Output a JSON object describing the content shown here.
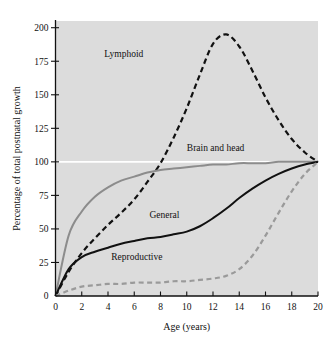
{
  "chart_data": {
    "type": "line",
    "title": "",
    "xlabel": "Age (years)",
    "ylabel": "Percentage of total postnatal growth",
    "xlim": [
      0,
      20
    ],
    "ylim": [
      0,
      205
    ],
    "xticks": [
      "0",
      "2",
      "4",
      "6",
      "8",
      "10",
      "12",
      "14",
      "16",
      "18",
      "20"
    ],
    "xtick_values": [
      0,
      2,
      4,
      6,
      8,
      10,
      12,
      14,
      16,
      18,
      20
    ],
    "yticks": [
      "25",
      "50",
      "75",
      "100",
      "125",
      "150",
      "175",
      "200"
    ],
    "ytick_values": [
      25,
      50,
      75,
      100,
      125,
      150,
      175,
      200
    ],
    "grid": false,
    "reference_line": {
      "value": 100,
      "color": "#ffffff",
      "label": "100 percent reference line"
    },
    "plot_background": "#dcdcdc",
    "legend_position": "inline-annotations",
    "x": [
      0,
      1,
      2,
      3,
      4,
      5,
      6,
      7,
      8,
      9,
      10,
      11,
      12,
      13,
      14,
      15,
      16,
      17,
      18,
      19,
      20
    ],
    "series": [
      {
        "name": "Lymphoid",
        "color": "#111111",
        "style": "dashed",
        "label_x": 5.2,
        "label_y": 178,
        "values": [
          0,
          18,
          32,
          43,
          53,
          62,
          72,
          85,
          99,
          118,
          140,
          165,
          188,
          195,
          186,
          168,
          148,
          131,
          117,
          107,
          100
        ]
      },
      {
        "name": "Brain and head",
        "color": "#8c8c8c",
        "style": "solid",
        "label_x": 12.2,
        "label_y": 108,
        "values": [
          0,
          45,
          63,
          74,
          81,
          86,
          89,
          92,
          94,
          95,
          96,
          97,
          98,
          98,
          99,
          99,
          99,
          100,
          100,
          100,
          100
        ]
      },
      {
        "name": "General",
        "color": "#111111",
        "style": "solid",
        "label_x": 8.3,
        "label_y": 58,
        "values": [
          0,
          20,
          29,
          33,
          36,
          39,
          41,
          43,
          44,
          46,
          48,
          52,
          58,
          65,
          73,
          80,
          86,
          91,
          95,
          98,
          100
        ]
      },
      {
        "name": "Reproductive",
        "color": "#9a9a9a",
        "style": "dashed",
        "label_x": 6.2,
        "label_y": 27,
        "values": [
          0,
          4,
          7,
          8,
          9,
          9,
          10,
          10,
          10,
          11,
          11,
          12,
          13,
          15,
          20,
          30,
          45,
          62,
          78,
          91,
          100
        ]
      }
    ]
  }
}
